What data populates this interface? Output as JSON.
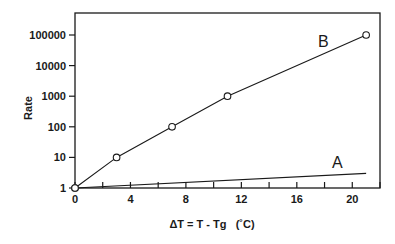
{
  "chart_data": {
    "type": "line",
    "title": "",
    "xlabel": "ΔT = T - Tg   (˚C)",
    "ylabel": "Rate",
    "xlim": [
      0,
      22
    ],
    "ylim": [
      1,
      100000
    ],
    "yscale": "log",
    "grid": false,
    "legend": "inline labels",
    "x_ticks": [
      0,
      4,
      8,
      12,
      16,
      20
    ],
    "x_minor_ticks": [
      2,
      6,
      10,
      14,
      18,
      22
    ],
    "y_ticks": [
      "1",
      "10",
      "100",
      "1000",
      "10000",
      "100000"
    ],
    "series": [
      {
        "name": "B",
        "markers": true,
        "x": [
          0,
          3,
          7,
          11,
          21
        ],
        "values": [
          1,
          10,
          100,
          1000,
          100000
        ]
      },
      {
        "name": "A",
        "markers": false,
        "x": [
          0,
          21
        ],
        "values": [
          1,
          3
        ]
      }
    ]
  },
  "colors": {
    "ink": "#1a1a1a",
    "background": "#ffffff"
  }
}
